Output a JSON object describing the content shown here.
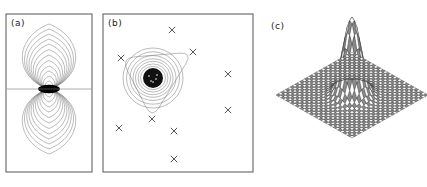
{
  "figure": {
    "width": 427,
    "height": 187,
    "background": "#ffffff",
    "panels": [
      {
        "id": "a",
        "label": "(a)",
        "label_x": 11,
        "label_y": 18,
        "type": "contour",
        "frame": {
          "x": 6,
          "y": 14,
          "width": 86,
          "height": 158
        },
        "description": "dipole-shaped nested contour map with dark saturated core",
        "center": {
          "x": 49,
          "y": 89
        },
        "midline_y": 89,
        "core": {
          "rx": 11,
          "ry": 4.2,
          "color": "#000000"
        },
        "lobes": [
          {
            "name": "upper",
            "direction": -1,
            "rings": 13
          },
          {
            "name": "lower",
            "direction": 1,
            "rings": 13
          }
        ],
        "ring_scale_rx": [
          3,
          5,
          7.5,
          10,
          12.5,
          15.5,
          18.5,
          21.5,
          24.5,
          27.5,
          30.5,
          33.5,
          36.5
        ],
        "ring_scale_ry": [
          4,
          8,
          13,
          18,
          23,
          28.5,
          34,
          39.5,
          45,
          50,
          55,
          60,
          65
        ]
      },
      {
        "id": "b",
        "label": "(b)",
        "label_x": 108,
        "label_y": 18,
        "type": "contour-scatter",
        "frame": {
          "x": 103,
          "y": 14,
          "width": 150,
          "height": 158
        },
        "description": "single dark peak with concentric contours and a rounded-triangle outer contour, plus scattered cross markers",
        "peak": {
          "x": 153,
          "y": 78
        },
        "core": {
          "r": 10,
          "color": "#111111"
        },
        "contour_radii": [
          12.5,
          15,
          17.5,
          20,
          23,
          26.5,
          30
        ],
        "outer_triangle": {
          "vertices": [
            {
              "x": 193,
              "y": 52
            },
            {
              "x": 152,
              "y": 119
            },
            {
              "x": 121,
              "y": 58
            }
          ],
          "corner_round": 14
        },
        "markers": [
          {
            "x": 172,
            "y": 30
          },
          {
            "x": 193,
            "y": 52
          },
          {
            "x": 121,
            "y": 58
          },
          {
            "x": 228,
            "y": 74
          },
          {
            "x": 152,
            "y": 119
          },
          {
            "x": 228,
            "y": 110
          },
          {
            "x": 119,
            "y": 128
          },
          {
            "x": 174,
            "y": 131
          },
          {
            "x": 174,
            "y": 159
          }
        ],
        "marker_glyph": "x",
        "marker_size": 3.2
      },
      {
        "id": "c",
        "label": "(c)",
        "label_x": 271,
        "label_y": 21,
        "type": "surface-mesh",
        "description": "wireframe mesh surface: flat diamond base plane with a single sharp central spike",
        "plot_origin": {
          "x": 352,
          "y": 95
        },
        "half_width": 76,
        "half_depth": 43,
        "grid_n": 32,
        "peak_height": 78,
        "peak_sigma": 0.085,
        "peak_center": {
          "u": 0.5,
          "v": 0.5
        },
        "line_color": "#2b2b2b"
      }
    ]
  },
  "chart_data": {
    "type": "line",
    "title": "",
    "subtitle": "",
    "xlabel": "",
    "ylabel": "",
    "panels": [
      {
        "label": "(a)",
        "type": "contour",
        "field": "dipole",
        "n_contours": 26,
        "symmetry": "antisymmetric about horizontal midline",
        "extrema": [
          {
            "sign": "positive",
            "x": 0.0,
            "y": 0.42
          },
          {
            "sign": "negative",
            "x": 0.0,
            "y": -0.42
          }
        ]
      },
      {
        "label": "(b)",
        "type": "contour",
        "field": "single-peak",
        "n_contours": 8,
        "peak_value": 1.0,
        "scatter_points": [
          [
            172,
            30
          ],
          [
            193,
            52
          ],
          [
            121,
            58
          ],
          [
            228,
            74
          ],
          [
            152,
            119
          ],
          [
            228,
            110
          ],
          [
            119,
            128
          ],
          [
            174,
            131
          ],
          [
            174,
            159
          ]
        ],
        "scatter_marker": "x"
      },
      {
        "label": "(c)",
        "type": "surface",
        "grid": [
          32,
          32
        ],
        "peak_value": 1.0,
        "baseline": 0.0,
        "projection": "isometric"
      }
    ],
    "legend": [],
    "grid": false
  }
}
